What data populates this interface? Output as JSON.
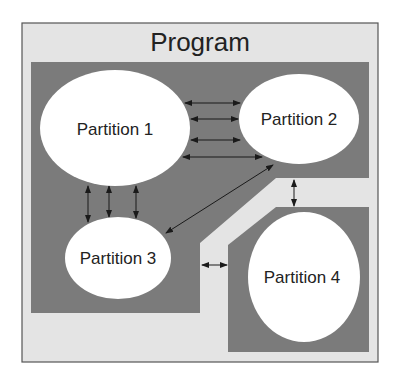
{
  "diagram": {
    "title": "Program",
    "colors": {
      "outer_fill": "#e4e4e4",
      "outer_border": "#555555",
      "region_fill": "#7b7b7b",
      "partition_fill": "#ffffff",
      "arrow": "#1a1a1a"
    },
    "partitions": [
      {
        "id": "p1",
        "label": "Partition 1"
      },
      {
        "id": "p2",
        "label": "Partition 2"
      },
      {
        "id": "p3",
        "label": "Partition 3"
      },
      {
        "id": "p4",
        "label": "Partition 4"
      }
    ],
    "connections": [
      {
        "from": "Partition 1",
        "to": "Partition 2",
        "count": 4,
        "type": "bidirectional"
      },
      {
        "from": "Partition 1",
        "to": "Partition 3",
        "count": 3,
        "type": "bidirectional"
      },
      {
        "from": "Partition 2",
        "to": "Partition 3",
        "count": 1,
        "type": "bidirectional"
      },
      {
        "from": "Partition 2",
        "to": "Partition 4",
        "count": 1,
        "type": "bidirectional"
      },
      {
        "from": "Partition 3",
        "to": "Partition 4",
        "count": 1,
        "type": "bidirectional"
      }
    ]
  }
}
